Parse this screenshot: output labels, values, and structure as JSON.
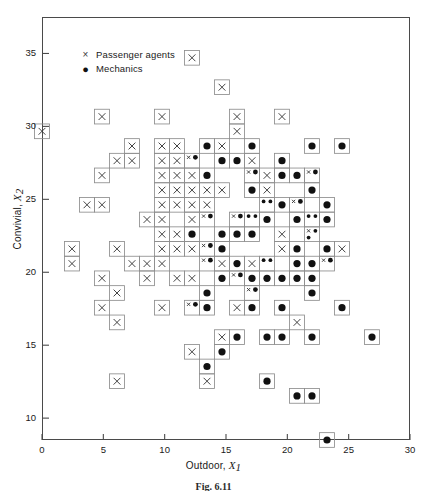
{
  "figure": {
    "caption": "Fig. 6.11"
  },
  "legend": {
    "position": "inside-top-left",
    "items": [
      {
        "glyph": "×",
        "icon": "cross-marker-icon",
        "label": "Passenger agents"
      },
      {
        "glyph": "●",
        "icon": "filled-circle-marker-icon",
        "label": "Mechanics"
      }
    ]
  },
  "axes": {
    "x": {
      "label_text": "Outdoor,",
      "label_var": "X",
      "label_sub": "1",
      "ticks": [
        "0",
        "5",
        "10",
        "15",
        "20",
        "25",
        "30"
      ],
      "tick_values": [
        0,
        5,
        10,
        15,
        20,
        25,
        30
      ],
      "range": [
        0,
        30
      ]
    },
    "y": {
      "label_text": "Convivial,",
      "label_var": "X",
      "label_sub": "2",
      "ticks": [
        "10",
        "15",
        "20",
        "25",
        "30",
        "35"
      ],
      "tick_values": [
        10,
        15,
        20,
        25,
        30,
        35
      ],
      "range": [
        8.5,
        37.5
      ]
    }
  },
  "colors": {
    "frame": "#4a4a4a",
    "cell_stroke": "#8e8e8e",
    "cross": "#3a3a3a",
    "dot": "#111111",
    "background": "#ffffff"
  },
  "chart_data": {
    "type": "scatter",
    "title": "",
    "subtitle": "",
    "xlabel": "Outdoor, X1",
    "ylabel": "Convivial, X2",
    "xlim": [
      0,
      30
    ],
    "ylim": [
      8.5,
      37.5
    ],
    "grid": false,
    "legend_position": "upper left (inside axes)",
    "binned": true,
    "bin_width_x": 1.22,
    "bin_width_y": 1.0,
    "series": [
      {
        "name": "Passenger agents",
        "marker": "cross",
        "points": [
          [
            0.3,
            29.5
          ],
          [
            4.6,
            30.6
          ],
          [
            12.6,
            34.6
          ],
          [
            14.6,
            32.6
          ],
          [
            9.7,
            30.6
          ],
          [
            15.8,
            30.6
          ],
          [
            15.8,
            29.5
          ],
          [
            19.5,
            30.6
          ],
          [
            6.8,
            28.5
          ],
          [
            5.6,
            27.5
          ],
          [
            6.8,
            27.5
          ],
          [
            9.7,
            28.5
          ],
          [
            9.7,
            27.5
          ],
          [
            10.9,
            27.5
          ],
          [
            12.1,
            27.5
          ],
          [
            4.4,
            26.5
          ],
          [
            9.7,
            26.5
          ],
          [
            11.5,
            26.5
          ],
          [
            12.7,
            26.5
          ],
          [
            16.6,
            26.5
          ],
          [
            18.5,
            26.5
          ],
          [
            9.7,
            25.4
          ],
          [
            10.9,
            25.4
          ],
          [
            12.1,
            25.4
          ],
          [
            13.3,
            25.4
          ],
          [
            14.5,
            25.4
          ],
          [
            3.6,
            24.4
          ],
          [
            4.8,
            24.4
          ],
          [
            10.2,
            24.4
          ],
          [
            11.4,
            24.4
          ],
          [
            12.6,
            24.4
          ],
          [
            13.8,
            24.4
          ],
          [
            8.2,
            23.4
          ],
          [
            9.4,
            23.4
          ],
          [
            12.0,
            23.4
          ],
          [
            13.2,
            23.4
          ],
          [
            16.3,
            23.4
          ],
          [
            3.0,
            21.3
          ],
          [
            6.3,
            21.3
          ],
          [
            9.6,
            22.3
          ],
          [
            10.8,
            22.3
          ],
          [
            9.6,
            21.3
          ],
          [
            10.8,
            21.3
          ],
          [
            12.0,
            21.3
          ],
          [
            13.2,
            21.3
          ],
          [
            1.9,
            20.3
          ],
          [
            7.0,
            20.3
          ],
          [
            8.9,
            20.3
          ],
          [
            9.6,
            20.3
          ],
          [
            13.6,
            20.3
          ],
          [
            15.2,
            20.3
          ],
          [
            17.3,
            20.3
          ],
          [
            4.6,
            19.3
          ],
          [
            6.0,
            19.0
          ],
          [
            8.5,
            19.3
          ],
          [
            11.0,
            19.3
          ],
          [
            12.8,
            19.3
          ],
          [
            16.2,
            19.8
          ],
          [
            5.5,
            17.3
          ],
          [
            6.4,
            17.0
          ],
          [
            9.5,
            17.3
          ],
          [
            11.8,
            17.3
          ],
          [
            15.5,
            17.3
          ],
          [
            16.6,
            18.3
          ],
          [
            21.5,
            26.5
          ],
          [
            20.5,
            24.4
          ],
          [
            20.0,
            23.0
          ],
          [
            22.0,
            22.3
          ],
          [
            18.8,
            25.4
          ],
          [
            6.5,
            12.5
          ],
          [
            13.2,
            12.5
          ],
          [
            17.0,
            28.0
          ],
          [
            14.4,
            28.5
          ],
          [
            11.0,
            29.0
          ],
          [
            24.0,
            22.0
          ],
          [
            23.0,
            20.5
          ],
          [
            19.0,
            21.5
          ],
          [
            15.0,
            16.0
          ],
          [
            12.4,
            14.8
          ],
          [
            21.0,
            17.0
          ]
        ]
      },
      {
        "name": "Mechanics",
        "marker": "filled-circle",
        "points": [
          [
            13.6,
            28.5
          ],
          [
            16.6,
            28.5
          ],
          [
            21.5,
            28.5
          ],
          [
            24.2,
            28.5
          ],
          [
            12.0,
            27.5
          ],
          [
            15.0,
            27.5
          ],
          [
            16.2,
            27.5
          ],
          [
            13.6,
            26.5
          ],
          [
            17.6,
            26.5
          ],
          [
            19.0,
            26.5
          ],
          [
            20.3,
            26.5
          ],
          [
            22.6,
            26.5
          ],
          [
            17.6,
            25.4
          ],
          [
            18.8,
            25.0
          ],
          [
            22.0,
            25.4
          ],
          [
            18.0,
            24.4
          ],
          [
            19.6,
            24.4
          ],
          [
            20.8,
            24.4
          ],
          [
            14.0,
            23.4
          ],
          [
            17.3,
            23.4
          ],
          [
            18.5,
            23.4
          ],
          [
            20.8,
            23.4
          ],
          [
            22.0,
            23.4
          ],
          [
            23.2,
            23.4
          ],
          [
            15.0,
            22.3
          ],
          [
            16.2,
            22.3
          ],
          [
            17.6,
            22.3
          ],
          [
            21.4,
            22.3
          ],
          [
            22.6,
            22.3
          ],
          [
            13.6,
            21.3
          ],
          [
            15.2,
            21.3
          ],
          [
            18.6,
            21.0
          ],
          [
            20.2,
            21.3
          ],
          [
            22.8,
            21.3
          ],
          [
            14.0,
            20.3
          ],
          [
            16.2,
            20.3
          ],
          [
            18.0,
            20.3
          ],
          [
            21.0,
            20.3
          ],
          [
            22.2,
            20.3
          ],
          [
            23.5,
            20.3
          ],
          [
            14.6,
            19.3
          ],
          [
            16.0,
            19.3
          ],
          [
            17.2,
            19.3
          ],
          [
            18.4,
            19.3
          ],
          [
            19.6,
            19.3
          ],
          [
            20.8,
            19.3
          ],
          [
            22.6,
            19.3
          ],
          [
            14.0,
            18.3
          ],
          [
            17.0,
            18.3
          ],
          [
            22.6,
            18.3
          ],
          [
            12.0,
            17.3
          ],
          [
            13.2,
            17.3
          ],
          [
            17.6,
            17.3
          ],
          [
            19.8,
            17.3
          ],
          [
            24.0,
            17.3
          ],
          [
            27.5,
            16.0
          ],
          [
            16.0,
            16.0
          ],
          [
            18.6,
            16.0
          ],
          [
            20.0,
            15.3
          ],
          [
            22.4,
            15.3
          ],
          [
            14.5,
            15.0
          ],
          [
            14.0,
            13.5
          ],
          [
            18.8,
            13.0
          ],
          [
            20.8,
            11.5
          ],
          [
            22.0,
            11.5
          ],
          [
            23.5,
            9.0
          ],
          [
            19.6,
            28.0
          ],
          [
            23.2,
            25.0
          ],
          [
            15.4,
            24.0
          ],
          [
            16.6,
            24.0
          ],
          [
            12.8,
            22.8
          ],
          [
            21.8,
            24.0
          ]
        ]
      }
    ]
  }
}
